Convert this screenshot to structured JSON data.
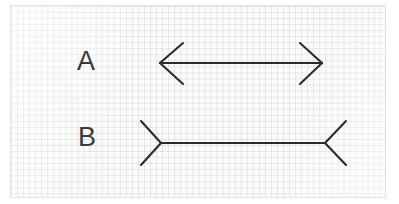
{
  "scene": {
    "kind": "muller-lyer-illusion-figure",
    "medium": "graph-paper-sketch",
    "background_color": "#ffffff",
    "paper_color": "#fbfbfa",
    "grid_color": "#c4c7c4",
    "ink_color": "#2b2b2b",
    "line_width": 2.1
  },
  "figures": [
    {
      "id": "A",
      "label": "A",
      "label_x": 88,
      "label_y": 62,
      "type": "arrow-inward-heads",
      "shaft": {
        "x1": 160,
        "y1": 63,
        "x2": 322,
        "y2": 63
      },
      "fins": [
        {
          "x1": 160,
          "y1": 63,
          "x2": 183,
          "y2": 43
        },
        {
          "x1": 160,
          "y1": 63,
          "x2": 183,
          "y2": 84
        },
        {
          "x1": 322,
          "y1": 63,
          "x2": 300,
          "y2": 43
        },
        {
          "x1": 322,
          "y1": 63,
          "x2": 300,
          "y2": 84
        }
      ],
      "shaft_length_px": 162
    },
    {
      "id": "B",
      "label": "B",
      "label_x": 88,
      "label_y": 138,
      "type": "arrow-outward-tails",
      "shaft": {
        "x1": 161,
        "y1": 143,
        "x2": 325,
        "y2": 143
      },
      "fins": [
        {
          "x1": 161,
          "y1": 143,
          "x2": 141,
          "y2": 121
        },
        {
          "x1": 161,
          "y1": 143,
          "x2": 141,
          "y2": 165
        },
        {
          "x1": 325,
          "y1": 143,
          "x2": 346,
          "y2": 121
        },
        {
          "x1": 325,
          "y1": 143,
          "x2": 346,
          "y2": 165
        }
      ],
      "shaft_length_px": 164
    }
  ],
  "paper": {
    "left": 11,
    "top": 6,
    "width": 374,
    "height": 191,
    "grid_cell_px": 6
  }
}
